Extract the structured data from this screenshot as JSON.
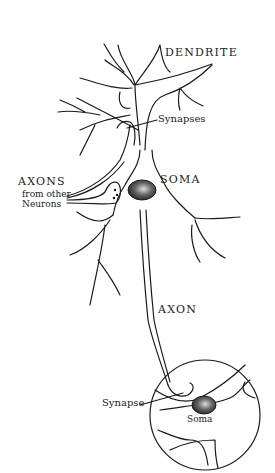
{
  "diagram": {
    "labels": {
      "dendrite": "DENDRITE",
      "synapses": "Synapses",
      "axons": "AXONS",
      "axons_sub1": "from other",
      "axons_sub2": "Neurons",
      "soma": "SOMA",
      "axon": "AXON",
      "synapse": "Synapse",
      "soma_inset": "Soma"
    },
    "colors": {
      "line": "#1a1a1a",
      "background": "#ffffff",
      "nucleus": "#333333"
    }
  }
}
